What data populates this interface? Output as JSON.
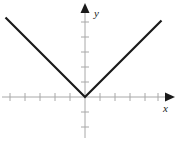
{
  "figure": {
    "background_color": "#ffffff"
  },
  "axes": {
    "x_label": "x",
    "y_label": "y",
    "axis_color": "#a8a8a8",
    "arrow_color": "#1a1a1a",
    "origin_px": {
      "x": 85,
      "y": 97
    },
    "tick_spacing_px": 15,
    "x_axis_ticks_left": 5,
    "x_axis_ticks_right": 5,
    "y_axis_ticks_above": 5,
    "y_axis_ticks_below": 3,
    "x_arrow_label_name": "x-axis-arrow",
    "y_arrow_label_name": "y-axis-arrow"
  },
  "chart_data": {
    "type": "line",
    "title": "",
    "subtitle": "",
    "xlabel": "x",
    "ylabel": "y",
    "xlim": [
      -5.7,
      5.7
    ],
    "ylim": [
      -3.2,
      5.5
    ],
    "grid": false,
    "legend": null,
    "equation": "y = |x|",
    "series": [
      {
        "name": "y = |x|",
        "color": "#1a1a1a",
        "x": [
          -5.3,
          0,
          5.1
        ],
        "values": [
          5.3,
          0,
          5.1
        ]
      }
    ],
    "annotations": [
      {
        "name": "vertex",
        "x": 0,
        "y": 0,
        "text": ""
      }
    ],
    "xtick_values": [
      -5,
      -4,
      -3,
      -2,
      -1,
      1,
      2,
      3,
      4,
      5
    ],
    "ytick_values": [
      -3,
      -2,
      -1,
      1,
      2,
      3,
      4,
      5
    ],
    "xtick_labels": [
      "",
      "",
      "",
      "",
      "",
      "",
      "",
      "",
      "",
      ""
    ],
    "ytick_labels": [
      "",
      "",
      "",
      "",
      "",
      "",
      "",
      ""
    ]
  }
}
